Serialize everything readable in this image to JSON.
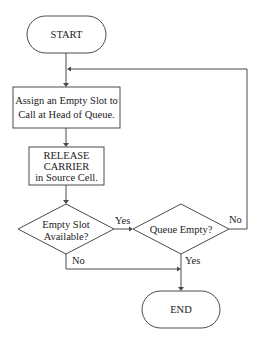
{
  "diagram": {
    "type": "flowchart",
    "nodes": {
      "start": {
        "label": "START",
        "shape": "terminator"
      },
      "assign": {
        "lines": [
          "Assign an Empty Slot to",
          "Call at Head of Queue."
        ],
        "shape": "process"
      },
      "release": {
        "lines": [
          "RELEASE",
          "CARRIER",
          "in Source Cell."
        ],
        "shape": "process"
      },
      "empty_slot": {
        "lines": [
          "Empty Slot",
          "Available?"
        ],
        "shape": "decision"
      },
      "queue_empty": {
        "label": "Queue Empty?",
        "shape": "decision"
      },
      "end": {
        "label": "END",
        "shape": "terminator"
      }
    },
    "edge_labels": {
      "empty_slot_yes": "Yes",
      "empty_slot_no": "No",
      "queue_empty_yes": "Yes",
      "queue_empty_no": "No"
    },
    "edges": [
      {
        "from": "START",
        "to": "Assign an Empty Slot to Call at Head of Queue."
      },
      {
        "from": "Assign an Empty Slot to Call at Head of Queue.",
        "to": "RELEASE CARRIER in Source Cell."
      },
      {
        "from": "RELEASE CARRIER in Source Cell.",
        "to": "Empty Slot Available?"
      },
      {
        "from": "Empty Slot Available?",
        "to": "Queue Empty?",
        "label": "Yes"
      },
      {
        "from": "Empty Slot Available?",
        "to": "END",
        "label": "No"
      },
      {
        "from": "Queue Empty?",
        "to": "END",
        "label": "Yes"
      },
      {
        "from": "Queue Empty?",
        "to": "Assign an Empty Slot to Call at Head of Queue.",
        "label": "No"
      }
    ],
    "colors": {
      "stroke": "#4a4a4a",
      "text": "#222222",
      "background": "#ffffff"
    }
  }
}
